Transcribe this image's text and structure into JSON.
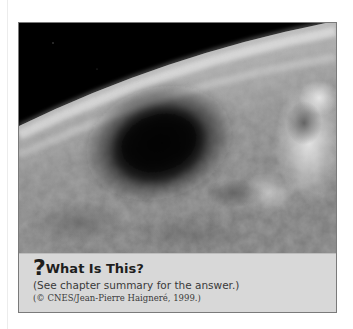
{
  "figure": {
    "photo": {
      "subject": "earth-from-orbit-with-eclipse-shadow",
      "alt": "Photograph of Earth from space showing a large dark shadow on the cloud cover"
    },
    "caption": {
      "icon": "question-mark-icon",
      "question_mark": "?",
      "title": "What Is This?",
      "subtitle": "(See chapter summary for the answer.)",
      "credit": "(© CNES/Jean-Pierre Haigneré, 1999.)"
    }
  },
  "colors": {
    "space": "#000000",
    "caption_bg": "#d8d8d8",
    "border": "#7a7a7a",
    "title_text": "#1e1e1e",
    "body_text": "#3a3a3a"
  }
}
